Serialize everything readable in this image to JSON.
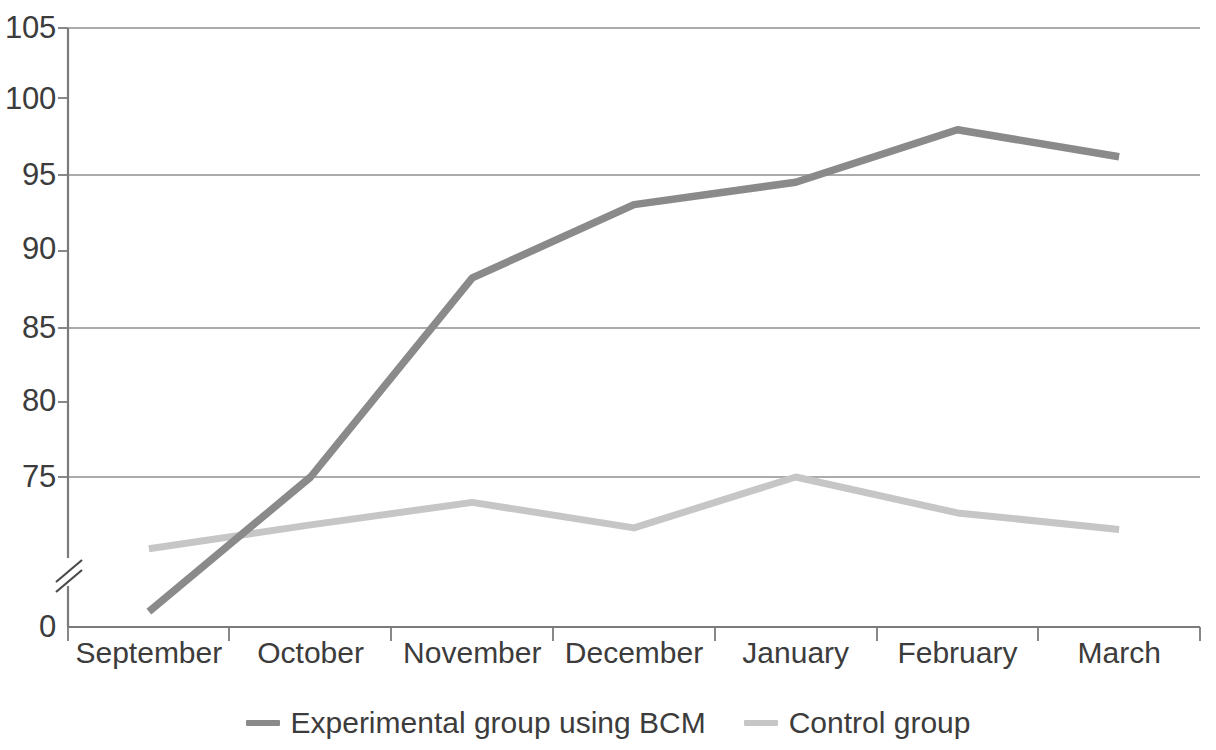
{
  "chart_data": {
    "type": "line",
    "title": "",
    "subtitle": "",
    "xlabel": "",
    "ylabel": "",
    "categories": [
      "September",
      "October",
      "November",
      "December",
      "January",
      "February",
      "March"
    ],
    "series": [
      {
        "name": "Experimental group using BCM",
        "color": "#8a8a8a",
        "values": [
          66.0,
          75.0,
          88.3,
          93.2,
          94.7,
          98.2,
          96.4
        ]
      },
      {
        "name": "Control group",
        "color": "#c6c6c6",
        "values": [
          70.2,
          71.8,
          73.3,
          71.6,
          75.0,
          72.6,
          71.5
        ]
      }
    ],
    "y_axis": {
      "tick_labels": [
        "105",
        "100",
        "95",
        "90",
        "85",
        "80",
        "75",
        "0"
      ],
      "tick_values": [
        105,
        100,
        95,
        90,
        85,
        80,
        75,
        0
      ],
      "gridline_values": [
        105,
        95,
        85,
        75
      ],
      "ylim": [
        65,
        105
      ],
      "axis_break": true,
      "axis_break_label": "//",
      "zero_baseline_label": "0",
      "grid": true
    },
    "x_axis": {
      "tick_count": 8,
      "grid": false
    },
    "legend": {
      "position": "bottom-center",
      "entries": [
        {
          "label": "Experimental group using BCM",
          "swatch": "line-swatch-dark",
          "color": "#8a8a8a"
        },
        {
          "label": "Control group",
          "swatch": "line-swatch-light",
          "color": "#c6c6c6"
        }
      ]
    },
    "colors": {
      "experimental": "#8a8a8a",
      "control": "#c6c6c6",
      "axis": "#7b7b7b",
      "gridline": "#8f8f8f",
      "text": "#3c3c3c",
      "background": "#ffffff"
    }
  },
  "notes": {
    "axis_break_glyph": "double-slash"
  }
}
